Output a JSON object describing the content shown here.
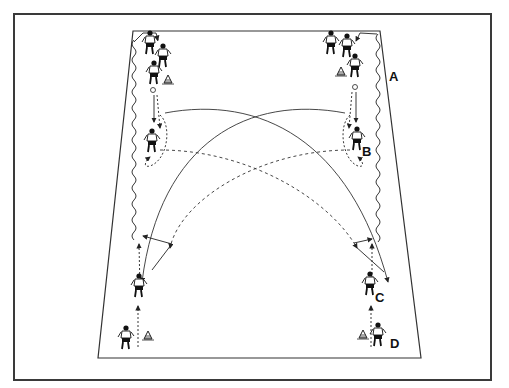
{
  "diagram": {
    "labels": {
      "A": "A",
      "B": "B",
      "C": "C",
      "D": "D"
    },
    "elements": {
      "field": "rectangular pitch area shown in perspective",
      "cones": 4,
      "players_top_left_group": 3,
      "players_top_right_group": 3,
      "legend": {
        "solid_line": "pass / ball path",
        "dashed_line": "player run",
        "wavy_line": "dribble"
      }
    },
    "colors": {
      "line": "#222222",
      "background": "#ffffff",
      "frame": "#3a3a3a"
    }
  }
}
